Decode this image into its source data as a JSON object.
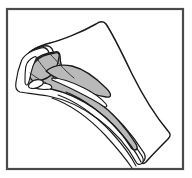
{
  "figure": {
    "type": "line-drawing",
    "caption": "",
    "canvas": {
      "width": 192,
      "height": 178
    },
    "colors": {
      "background": "#ffffff",
      "frame_stroke": "#4a4a4a",
      "outline_stroke": "#1a1a1a",
      "fill_light": "#ffffff",
      "fill_gray": "#b9b9b9",
      "fill_dark": "#2a2a2a"
    },
    "frame": {
      "x": 7,
      "y": 9,
      "width": 176,
      "height": 160,
      "stroke_width": 2.2
    },
    "paths": {
      "outer_body": "M 27 56 C 30 50 38 46 50 43 C 62 40 82 32 96 24 C 100 21 104 21 106 24 C 112 33 122 53 132 74 C 141 92 152 112 168 131 C 171 134 171 136 168 139 C 160 147 152 155 146 162 C 144 164 142 164 141 162 C 136 152 128 140 118 128 C 104 112 86 98 66 92 C 52 88 40 86 32 86 C 27 86 24 82 24 76 C 24 68 25 61 27 56 Z",
      "band_outer": "M 24 60 C 26 53 33 49 44 46 C 48 45 52 47 53 51 C 55 58 58 66 63 73 C 70 83 84 92 100 104 C 116 116 132 134 144 153 C 146 157 145 160 143 162 C 141 164 139 163 138 161 C 130 146 116 129 100 116 C 84 103 66 95 50 92 C 38 90 28 89 22 88 C 18 87 17 84 18 78 C 19 70 21 64 24 60 Z",
      "band_mid": "M 21 62 C 23 55 30 51 41 48 C 45 47 48 49 49 53 C 52 61 56 70 62 78 C 70 88 84 97 99 108 C 115 120 131 138 142 156 C 144 160 143 163 141 164 C 139 165 137 164 136 162 C 128 147 114 131 98 119 C 82 107 64 99 48 96 C 36 94 26 93 20 92 C 16 91 15 88 16 82 C 17 74 19 67 21 62 Z",
      "gray_core": "M 34 61 C 38 56 46 53 55 52 C 58 51 60 53 60 56 C 60 62 62 69 66 75 C 72 84 84 92 98 102 C 112 112 126 128 136 144 C 138 148 137 150 135 150 C 133 150 131 148 130 146 C 122 133 109 119 95 109 C 81 99 65 92 51 89 C 42 87 35 86 31 85 C 28 84 27 81 28 76 C 29 70 31 65 34 61 Z",
      "gray_upper_lobe": "M 35 62 C 39 57 47 54 55 53 C 58 52 60 54 59 57 C 58 63 57 68 54 72 C 50 77 44 80 38 81 C 34 82 31 80 30 77 C 29 72 31 66 35 62 Z",
      "gray_wing": "M 46 71 C 52 66 62 64 72 66 C 84 69 96 78 106 88 C 112 94 112 98 106 97 C 94 95 80 90 68 84 C 58 79 50 75 46 71 Z",
      "inner_slit_a": "M 52 78 C 60 78 72 82 84 88 C 94 93 102 99 106 104 C 108 107 106 108 103 106 C 96 101 86 96 76 91 C 66 86 57 82 52 80 Z",
      "inner_slit_b": "M 32 84 C 36 82 42 82 48 84 C 52 85 53 88 50 89 C 44 90 37 89 33 87 C 31 86 31 85 32 84 Z",
      "notch_dark": "M 30 83 C 33 80 37 79 41 80 C 44 81 44 83 42 85 C 38 88 33 89 30 88 C 28 87 28 85 30 83 Z",
      "left_ridge": "M 26 66 C 27 62 30 59 34 57 C 36 56 37 57 36 59 C 34 63 32 68 31 73 C 30 78 29 82 28 84 C 27 86 25 85 25 82 C 25 76 25 70 26 66 Z",
      "tail_line_1": "M 66 92 C 84 99 102 113 118 130 C 128 141 136 152 141 162",
      "tail_line_2": "M 58 95 C 78 102 96 116 112 133 C 122 144 131 156 136 166",
      "tail_line_3": "M 52 98 C 72 105 90 119 106 136 C 116 147 126 159 132 168",
      "hair_line_1": "M 50 54 C 56 60 64 70 74 78",
      "hair_line_2": "M 38 60 C 42 66 48 73 55 79",
      "hair_line_3": "M 30 73 C 34 76 40 80 46 83"
    }
  }
}
